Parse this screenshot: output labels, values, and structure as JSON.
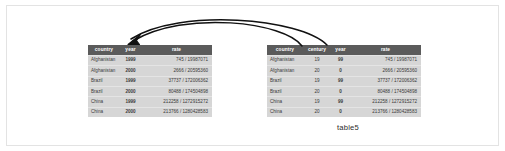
{
  "figure": {
    "caption": "table5",
    "colors": {
      "header_bg": "#5b5b5b",
      "header_text": "#ffffff",
      "row_bg": "#d6d6d6",
      "row_text": "#3a3a3a",
      "frame_border": "#e3e3e3",
      "arrow": "#111111",
      "page_bg": "#ffffff"
    }
  },
  "left_table": {
    "name": "table-left",
    "columns": [
      "country",
      "year",
      "rate"
    ],
    "rows": [
      {
        "country": "Afghanistan",
        "year": "1999",
        "rate": "745 / 19987071"
      },
      {
        "country": "Afghanistan",
        "year": "2000",
        "rate": "2666 / 20595360"
      },
      {
        "country": "Brazil",
        "year": "1999",
        "rate": "37737 / 172006362"
      },
      {
        "country": "Brazil",
        "year": "2000",
        "rate": "80488 / 174504898"
      },
      {
        "country": "China",
        "year": "1999",
        "rate": "212258 / 1272915272"
      },
      {
        "country": "China",
        "year": "2000",
        "rate": "213766 / 1280428583"
      }
    ]
  },
  "right_table": {
    "name": "table-right",
    "columns": [
      "country",
      "century",
      "year",
      "rate"
    ],
    "rows": [
      {
        "country": "Afghanistan",
        "century": "19",
        "year": "99",
        "rate": "745 / 19987071"
      },
      {
        "country": "Afghanistan",
        "century": "20",
        "year": "0",
        "rate": "2666 / 20595360"
      },
      {
        "country": "Brazil",
        "century": "19",
        "year": "99",
        "rate": "37737 / 172006362"
      },
      {
        "country": "Brazil",
        "century": "20",
        "year": "0",
        "rate": "80488 / 174504898"
      },
      {
        "country": "China",
        "century": "19",
        "year": "99",
        "rate": "212258 / 1272915272"
      },
      {
        "country": "China",
        "century": "20",
        "year": "0",
        "rate": "213766 / 1280428583"
      }
    ]
  },
  "arrows": [
    {
      "name": "arrow-century-to-year",
      "from": "right_table.century",
      "to": "left_table.year"
    },
    {
      "name": "arrow-year-to-year",
      "from": "right_table.year",
      "to": "left_table.year"
    }
  ]
}
